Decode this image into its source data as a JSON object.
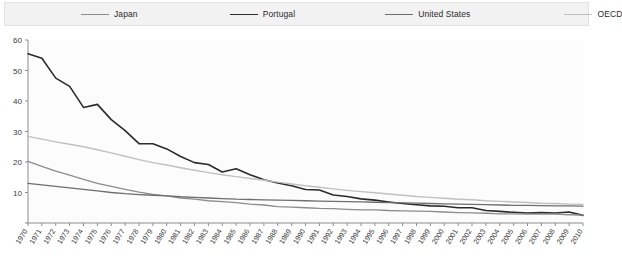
{
  "legend": {
    "position": "top",
    "items": [
      {
        "label": "Japan",
        "color": "#8c8c8c",
        "width": 1.3
      },
      {
        "label": "Portugal",
        "color": "#2b2b2b",
        "width": 1.6
      },
      {
        "label": "United States",
        "color": "#6e6e6e",
        "width": 1.3
      },
      {
        "label": "OECD",
        "color": "#c0c0c0",
        "width": 1.4
      }
    ]
  },
  "chart_data": {
    "type": "line",
    "title": "",
    "subtitle": "",
    "xlabel": "",
    "ylabel": "",
    "xlim": [
      1970,
      2010
    ],
    "ylim": [
      0,
      60
    ],
    "yticks": [
      0,
      10,
      20,
      30,
      40,
      50,
      60
    ],
    "grid": false,
    "legend_position": "top",
    "x": [
      1970,
      1971,
      1972,
      1973,
      1974,
      1975,
      1976,
      1977,
      1978,
      1979,
      1980,
      1981,
      1982,
      1983,
      1984,
      1985,
      1986,
      1987,
      1988,
      1989,
      1990,
      1991,
      1992,
      1993,
      1994,
      1995,
      1996,
      1997,
      1998,
      1999,
      2000,
      2001,
      2002,
      2003,
      2004,
      2005,
      2006,
      2007,
      2008,
      2009,
      2010
    ],
    "xticks": [
      "1970",
      "1971",
      "1972",
      "1973",
      "1974",
      "1975",
      "1976",
      "1977",
      "1978",
      "1979",
      "1980",
      "1981",
      "1982",
      "1983",
      "1984",
      "1985",
      "1986",
      "1987",
      "1988",
      "1989",
      "1990",
      "1991",
      "1992",
      "1993",
      "1994",
      "1995",
      "1996",
      "1997",
      "1998",
      "1999",
      "2000",
      "2001",
      "2002",
      "2003",
      "2004",
      "2005",
      "2006",
      "2007",
      "2008",
      "2009",
      "2010"
    ],
    "series": [
      {
        "name": "Portugal",
        "color": "#2b2b2b",
        "width": 1.6,
        "values": [
          55.5,
          54.0,
          47.5,
          44.8,
          37.9,
          38.9,
          33.9,
          30.3,
          26.0,
          26.0,
          24.3,
          21.8,
          19.8,
          19.2,
          16.7,
          17.8,
          15.8,
          14.2,
          13.1,
          12.2,
          11.0,
          10.8,
          9.2,
          8.7,
          7.9,
          7.5,
          6.9,
          6.4,
          6.0,
          5.6,
          5.5,
          5.0,
          5.0,
          4.1,
          3.8,
          3.5,
          3.3,
          3.4,
          3.3,
          3.6,
          2.5
        ]
      },
      {
        "name": "OECD",
        "color": "#c0c0c0",
        "width": 1.4,
        "values": [
          28.4,
          27.5,
          26.6,
          25.8,
          25.0,
          24.0,
          23.0,
          21.9,
          20.8,
          19.8,
          19.0,
          18.1,
          17.3,
          16.5,
          15.8,
          15.2,
          14.6,
          14.0,
          13.4,
          12.8,
          12.2,
          11.7,
          11.2,
          10.7,
          10.3,
          9.9,
          9.5,
          9.1,
          8.7,
          8.4,
          8.1,
          7.8,
          7.6,
          7.3,
          7.1,
          6.9,
          6.7,
          6.5,
          6.4,
          6.2,
          6.1
        ]
      },
      {
        "name": "Japan",
        "color": "#8c8c8c",
        "width": 1.3,
        "values": [
          20.2,
          18.6,
          17.0,
          15.7,
          14.3,
          13.0,
          12.0,
          11.0,
          10.1,
          9.4,
          8.9,
          8.2,
          7.8,
          7.3,
          7.0,
          6.7,
          6.2,
          5.9,
          5.4,
          5.2,
          5.0,
          4.8,
          4.7,
          4.5,
          4.3,
          4.3,
          4.1,
          4.0,
          3.9,
          3.8,
          3.6,
          3.4,
          3.3,
          3.2,
          3.0,
          3.0,
          2.9,
          3.0,
          2.9,
          2.7,
          2.6
        ]
      },
      {
        "name": "United States",
        "color": "#6e6e6e",
        "width": 1.3,
        "values": [
          13.0,
          12.5,
          12.0,
          11.5,
          11.0,
          10.5,
          10.0,
          9.6,
          9.3,
          9.1,
          8.9,
          8.6,
          8.4,
          8.2,
          8.0,
          7.8,
          7.7,
          7.6,
          7.5,
          7.4,
          7.3,
          7.2,
          7.1,
          7.0,
          6.9,
          6.8,
          6.7,
          6.6,
          6.5,
          6.4,
          6.3,
          6.2,
          6.1,
          6.0,
          5.9,
          5.8,
          5.8,
          5.7,
          5.6,
          5.6,
          5.5
        ]
      }
    ]
  }
}
